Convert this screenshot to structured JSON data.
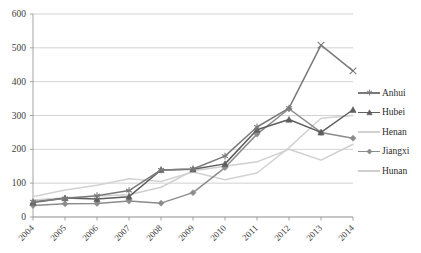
{
  "chart_data": {
    "type": "line",
    "title": "",
    "xlabel": "",
    "ylabel": "",
    "categories": [
      "2004",
      "2005",
      "2006",
      "2007",
      "2008",
      "2009",
      "2010",
      "2011",
      "2012",
      "2013",
      "2014"
    ],
    "ylim": [
      0,
      600
    ],
    "ytick_values": [
      0,
      100,
      200,
      300,
      400,
      500,
      600
    ],
    "ytick_labels": [
      "0",
      "100",
      "200",
      "300",
      "400",
      "500",
      "600"
    ],
    "grid": true,
    "legend_position": "right",
    "series": [
      {
        "name": "Anhui",
        "color": "#7a7a7a",
        "marker": "asterisk",
        "values": [
          45,
          55,
          63,
          78,
          139,
          142,
          180,
          266,
          322,
          508,
          null
        ]
      },
      {
        "name": "Hubei",
        "color": "#5e5e5e",
        "marker": "triangle",
        "values": [
          43,
          56,
          53,
          60,
          139,
          141,
          157,
          258,
          288,
          250,
          317
        ]
      },
      {
        "name": "Henan",
        "color": "#d2d2d2",
        "marker": "none",
        "values": [
          60,
          80,
          94,
          113,
          105,
          133,
          110,
          130,
          205,
          292,
          300
        ]
      },
      {
        "name": "Jiangxi",
        "color": "#8c8c8c",
        "marker": "diamond",
        "values": [
          34,
          39,
          40,
          47,
          41,
          72,
          146,
          245,
          320,
          250,
          233
        ]
      },
      {
        "name": "Hunan",
        "color": "#cfcfcf",
        "marker": "none",
        "values": [
          50,
          57,
          62,
          66,
          88,
          137,
          150,
          163,
          200,
          168,
          215
        ]
      }
    ],
    "annotations": {
      "anhui_last_point_note": "Anhui series ends at 2014 value 432",
      "anhui_2014": 432
    }
  },
  "legend": {
    "items": [
      {
        "label": "Anhui"
      },
      {
        "label": "Hubei"
      },
      {
        "label": "Henan"
      },
      {
        "label": "Jiangxi"
      },
      {
        "label": "Hunan"
      }
    ]
  }
}
